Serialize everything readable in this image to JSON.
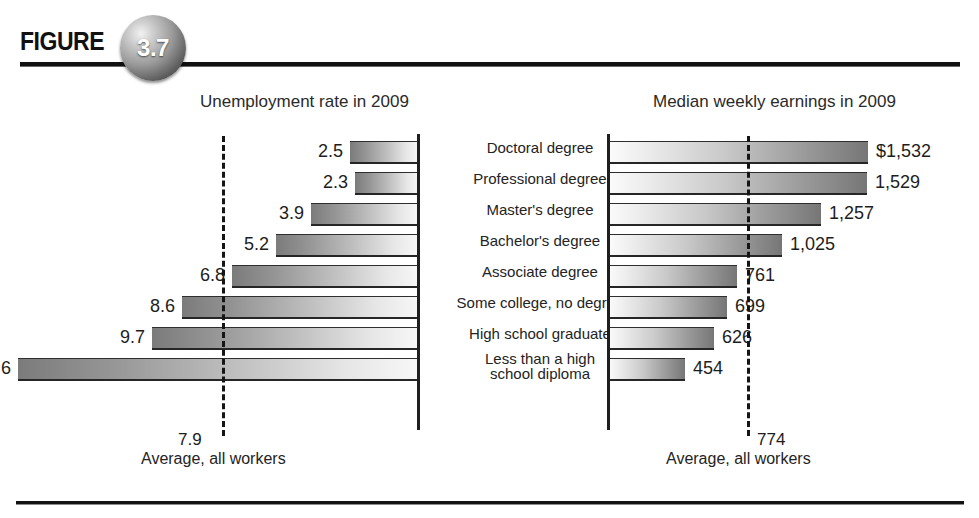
{
  "figure": {
    "label": "FIGURE",
    "number": "3.7"
  },
  "panels": {
    "left_title": "Unemployment rate in 2009",
    "right_title": "Median weekly earnings in 2009",
    "left_average_value": "7.9",
    "right_average_value": "774",
    "left_average_label": "Average, all workers",
    "right_average_label": "Average, all workers"
  },
  "chart_data": {
    "type": "bar",
    "orientation": "horizontal-diverging",
    "categories": [
      "Doctoral degree",
      "Professional degree",
      "Master's degree",
      "Bachelor's degree",
      "Associate degree",
      "Some college, no degree",
      "High school graduate",
      "Less than a high school diploma"
    ],
    "category_lines": [
      [
        "Doctoral degree"
      ],
      [
        "Professional degree"
      ],
      [
        "Master's degree"
      ],
      [
        "Bachelor's degree"
      ],
      [
        "Associate degree"
      ],
      [
        "Some college, no degree"
      ],
      [
        "High school graduate"
      ],
      [
        "Less than a high",
        "school diploma"
      ]
    ],
    "series": [
      {
        "name": "Unemployment rate in 2009",
        "unit": "percent",
        "direction": "left",
        "xlabel": "Unemployment rate in 2009",
        "values": [
          2.5,
          2.3,
          3.9,
          5.2,
          6.8,
          8.6,
          9.7,
          14.6
        ],
        "labels": [
          "2.5",
          "2.3",
          "3.9",
          "5.2",
          "6.8",
          "8.6",
          "9.7",
          "14.6"
        ],
        "reference_line": {
          "value": 7.9,
          "label": "7.9",
          "caption": "Average, all workers",
          "style": "dashed"
        },
        "xlim": [
          0,
          16
        ]
      },
      {
        "name": "Median weekly earnings in 2009",
        "unit": "US dollars per week",
        "direction": "right",
        "xlabel": "Median weekly earnings in 2009",
        "values": [
          1532,
          1529,
          1257,
          1025,
          761,
          699,
          626,
          454
        ],
        "labels": [
          "$1,532",
          "1,529",
          "1,257",
          "1,025",
          "761",
          "699",
          "626",
          "454"
        ],
        "reference_line": {
          "value": 774,
          "label": "774",
          "caption": "Average, all workers",
          "style": "dashed"
        },
        "xlim": [
          0,
          1700
        ]
      }
    ],
    "grid": false,
    "legend": "none"
  },
  "colors": {
    "bar_dark": "#7b7b7b",
    "bar_light": "#f7f7f7",
    "axis": "#1f1f1f",
    "dashed_line": "#151515",
    "text": "#1d1d1d"
  }
}
